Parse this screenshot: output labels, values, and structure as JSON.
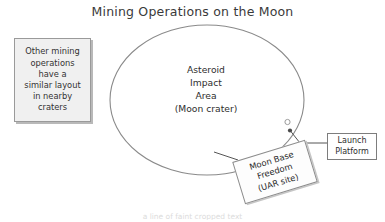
{
  "diagram": {
    "title": "Mining Operations on the Moon",
    "crater": {
      "label": "Asteroid\nImpact\nArea\n(Moon crater)",
      "shape": "ellipse",
      "stroke_color": "#8a8a8a",
      "fill_color": "#ffffff"
    },
    "note": {
      "text": "Other mining\noperations\nhave a\nsimilar layout\nin nearby\ncraters",
      "fill_color": "#f0f0f0",
      "border_color": "#9a9a9a"
    },
    "launch_platform": {
      "label": "Launch\nPlatform",
      "marker_icon": "circle-outline-marker",
      "anchor_icon": "filled-dot-marker",
      "border_color": "#7d7d7d"
    },
    "moon_base": {
      "label": "Moon Base\nFreedom\n(UAR site)",
      "rotation_degrees": -17,
      "border_color": "#8c8c8c"
    },
    "bottom_ghost_text": "a line of faint cropped text"
  }
}
